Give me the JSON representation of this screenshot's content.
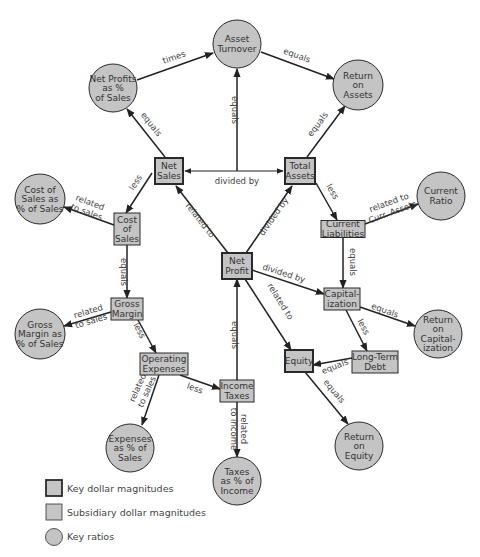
{
  "colors": {
    "fill": "#c4c4c4",
    "stroke": "#2a2a2a",
    "edge": "#222222",
    "text": "#333333"
  },
  "nodes": [
    {
      "id": "npps",
      "type": "ratio",
      "lines": [
        "Net Profits",
        "as %",
        "of Sales"
      ],
      "x": 113,
      "y": 88,
      "r": 24
    },
    {
      "id": "at",
      "type": "ratio",
      "lines": [
        "Asset",
        "Turnover"
      ],
      "x": 237,
      "y": 44,
      "r": 24
    },
    {
      "id": "roa",
      "type": "ratio",
      "lines": [
        "Return",
        "on",
        "Assets"
      ],
      "x": 358,
      "y": 85,
      "r": 25
    },
    {
      "id": "ns",
      "type": "key",
      "lines": [
        "Net",
        "Sales"
      ],
      "x": 169,
      "y": 171,
      "w": 28,
      "h": 26
    },
    {
      "id": "ta",
      "type": "key",
      "lines": [
        "Total",
        "Assets"
      ],
      "x": 300,
      "y": 171,
      "w": 30,
      "h": 26
    },
    {
      "id": "csps",
      "type": "ratio",
      "lines": [
        "Cost of",
        "Sales as",
        "% of Sales"
      ],
      "x": 40,
      "y": 199,
      "r": 25
    },
    {
      "id": "cs",
      "type": "sub",
      "lines": [
        "Cost",
        "of",
        "Sales"
      ],
      "x": 127,
      "y": 229,
      "w": 26,
      "h": 32
    },
    {
      "id": "cr",
      "type": "ratio",
      "lines": [
        "Current",
        "Ratio"
      ],
      "x": 441,
      "y": 196,
      "r": 24
    },
    {
      "id": "cl",
      "type": "sub",
      "lines": [
        "Current",
        "Liabilities"
      ],
      "x": 343,
      "y": 229,
      "w": 44,
      "h": 17
    },
    {
      "id": "np",
      "type": "key",
      "lines": [
        "Net",
        "Profit"
      ],
      "x": 237,
      "y": 266,
      "w": 30,
      "h": 26
    },
    {
      "id": "gm",
      "type": "sub",
      "lines": [
        "Gross",
        "Margin"
      ],
      "x": 127,
      "y": 309,
      "w": 32,
      "h": 22
    },
    {
      "id": "gmps",
      "type": "ratio",
      "lines": [
        "Gross",
        "Margin as",
        "% of Sales"
      ],
      "x": 40,
      "y": 334,
      "r": 25
    },
    {
      "id": "cap",
      "type": "sub",
      "lines": [
        "Capital-",
        "ization"
      ],
      "x": 342,
      "y": 299,
      "w": 36,
      "h": 22
    },
    {
      "id": "roc",
      "type": "ratio",
      "lines": [
        "Return",
        "on",
        "Capital-",
        "ization"
      ],
      "x": 438,
      "y": 334,
      "r": 24
    },
    {
      "id": "oe",
      "type": "sub",
      "lines": [
        "Operating",
        "Expenses"
      ],
      "x": 164,
      "y": 364,
      "w": 48,
      "h": 22
    },
    {
      "id": "eq",
      "type": "key",
      "lines": [
        "Equity"
      ],
      "x": 299,
      "y": 361,
      "w": 28,
      "h": 22
    },
    {
      "id": "ltd",
      "type": "sub",
      "lines": [
        "Long-Term",
        "Debt"
      ],
      "x": 375,
      "y": 362,
      "w": 46,
      "h": 22
    },
    {
      "id": "it",
      "type": "sub",
      "lines": [
        "Income",
        "Taxes"
      ],
      "x": 237,
      "y": 391,
      "w": 34,
      "h": 22
    },
    {
      "id": "eps",
      "type": "ratio",
      "lines": [
        "Expenses",
        "as % of",
        "Sales"
      ],
      "x": 130,
      "y": 448,
      "r": 24
    },
    {
      "id": "roe",
      "type": "ratio",
      "lines": [
        "Return",
        "on",
        "Equity"
      ],
      "x": 359,
      "y": 446,
      "r": 24
    },
    {
      "id": "tpi",
      "type": "ratio",
      "lines": [
        "Taxes",
        "as % of",
        "Income"
      ],
      "x": 237,
      "y": 481,
      "r": 24
    }
  ],
  "edges": [
    {
      "id": "e1",
      "from": [
        137,
        80
      ],
      "to": [
        213,
        53
      ],
      "label": [
        "times"
      ],
      "lx": 175,
      "ly": 60,
      "rot": -19
    },
    {
      "id": "e2",
      "from": [
        261,
        52
      ],
      "to": [
        334,
        79
      ],
      "label": [
        "equals"
      ],
      "lx": 296,
      "ly": 58,
      "rot": 20
    },
    {
      "id": "e3",
      "from": [
        165,
        157
      ],
      "to": [
        127,
        109
      ],
      "label": [
        "equals"
      ],
      "lx": 149,
      "ly": 126,
      "rot": 52
    },
    {
      "id": "e4",
      "from": [
        237,
        171
      ],
      "to": [
        237,
        69
      ],
      "label": [
        "equals"
      ],
      "lx": 232,
      "ly": 110,
      "rot": 90
    },
    {
      "id": "e5",
      "from": [
        307,
        157
      ],
      "to": [
        345,
        106
      ],
      "label": [
        "equals"
      ],
      "lx": 320,
      "ly": 126,
      "rot": -53
    },
    {
      "id": "e6",
      "from": [
        152,
        173
      ],
      "to": [
        126,
        213
      ],
      "label": [
        "less"
      ],
      "lx": 138,
      "ly": 184,
      "rot": -57
    },
    {
      "id": "e7",
      "from": [
        114,
        225
      ],
      "to": [
        64,
        207
      ],
      "label": [
        "related",
        "to sales"
      ],
      "lx": 88,
      "ly": 208,
      "rot": 20
    },
    {
      "id": "e8",
      "from": [
        316,
        183
      ],
      "to": [
        337,
        220
      ],
      "label": [
        "less"
      ],
      "lx": 330,
      "ly": 193,
      "rot": 60
    },
    {
      "id": "e9",
      "from": [
        365,
        224
      ],
      "to": [
        418,
        204
      ],
      "label": [
        "related to",
        "Curr. Assets"
      ],
      "lx": 391,
      "ly": 208,
      "rot": -20
    },
    {
      "id": "e10",
      "from": [
        127,
        245
      ],
      "to": [
        127,
        298
      ],
      "label": [
        "equals"
      ],
      "lx": 121,
      "ly": 272,
      "rot": 90
    },
    {
      "id": "e11",
      "from": [
        343,
        238
      ],
      "to": [
        343,
        288
      ],
      "label": [
        "equals"
      ],
      "lx": 350,
      "ly": 262,
      "rot": 90
    },
    {
      "id": "e12",
      "from": [
        111,
        312
      ],
      "to": [
        64,
        326
      ],
      "label": [
        "related",
        "to sales"
      ],
      "lx": 90,
      "ly": 317,
      "rot": -17
    },
    {
      "id": "e13",
      "from": [
        138,
        320
      ],
      "to": [
        156,
        353
      ],
      "label": [
        "less"
      ],
      "lx": 137,
      "ly": 332,
      "rot": 62
    },
    {
      "id": "e14",
      "from": [
        252,
        270
      ],
      "to": [
        324,
        294
      ],
      "label": [
        "divided by"
      ],
      "lx": 283,
      "ly": 276,
      "rot": 18
    },
    {
      "id": "e15",
      "from": [
        360,
        307
      ],
      "to": [
        415,
        326
      ],
      "label": [
        "equals"
      ],
      "lx": 384,
      "ly": 313,
      "rot": 20
    },
    {
      "id": "e16",
      "from": [
        346,
        310
      ],
      "to": [
        367,
        351
      ],
      "label": [
        "less"
      ],
      "lx": 361,
      "ly": 328,
      "rot": 63
    },
    {
      "id": "e17",
      "from": [
        245,
        279
      ],
      "to": [
        291,
        350
      ],
      "label": [
        "related to"
      ],
      "lx": 278,
      "ly": 303,
      "rot": 58
    },
    {
      "id": "e18",
      "from": [
        352,
        358
      ],
      "to": [
        313,
        365
      ],
      "label": [
        "equals"
      ],
      "lx": 336,
      "ly": 369,
      "rot": -22
    },
    {
      "id": "e19",
      "from": [
        237,
        380
      ],
      "to": [
        237,
        279
      ],
      "label": [
        "equals"
      ],
      "lx": 232,
      "ly": 335,
      "rot": 90
    },
    {
      "id": "e20",
      "from": [
        180,
        375
      ],
      "to": [
        220,
        389
      ],
      "label": [
        "less"
      ],
      "lx": 194,
      "ly": 391,
      "rot": 20
    },
    {
      "id": "e21",
      "from": [
        159,
        375
      ],
      "to": [
        142,
        425
      ],
      "label": [
        "related",
        "to sales"
      ],
      "lx": 143,
      "ly": 390,
      "rot": -66
    },
    {
      "id": "e22",
      "from": [
        237,
        402
      ],
      "to": [
        237,
        457
      ],
      "label": [
        "related",
        "to income"
      ],
      "lx": 238,
      "ly": 429,
      "rot": 90
    },
    {
      "id": "e23",
      "from": [
        305,
        372
      ],
      "to": [
        348,
        424
      ],
      "label": [
        "equals"
      ],
      "lx": 332,
      "ly": 393,
      "rot": 50
    }
  ],
  "bar_edges": [
    {
      "id": "divided-by-top",
      "label": "divided by",
      "lx": 237,
      "ly": 183
    }
  ],
  "diagonal_edges": [
    {
      "id": "ns-np",
      "label": "related to",
      "lx": 196,
      "ly": 225,
      "rot": 52
    },
    {
      "id": "np-ta",
      "label": "divided by",
      "lx": 278,
      "ly": 220,
      "rot": -52
    }
  ],
  "legend": {
    "key_dollar": "Key dollar magnitudes",
    "subsidiary_dollar": "Subsidiary dollar magnitudes",
    "key_ratios": "Key ratios"
  }
}
